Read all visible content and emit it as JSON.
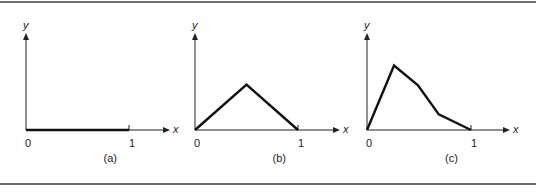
{
  "panels": [
    {
      "id": "a",
      "caption": "(a)",
      "x_axis_label": "x",
      "y_axis_label": "y",
      "tick_labels": [
        "0",
        "1"
      ],
      "origin": [
        26,
        130
      ],
      "unit_px": 103,
      "axis_end_x": 170,
      "axis_top_y": 33,
      "points": [
        [
          0,
          0
        ],
        [
          1,
          0
        ]
      ]
    },
    {
      "id": "b",
      "caption": "(b)",
      "x_axis_label": "x",
      "y_axis_label": "y",
      "tick_labels": [
        "0",
        "1"
      ],
      "origin": [
        195,
        130
      ],
      "unit_px": 103,
      "axis_end_x": 340,
      "axis_top_y": 33,
      "points": [
        [
          0,
          0
        ],
        [
          0.5,
          0.44
        ],
        [
          1,
          0
        ]
      ]
    },
    {
      "id": "c",
      "caption": "(c)",
      "x_axis_label": "x",
      "y_axis_label": "y",
      "tick_labels": [
        "0",
        "1"
      ],
      "origin": [
        367,
        130
      ],
      "unit_px": 104,
      "axis_end_x": 510,
      "axis_top_y": 33,
      "points": [
        [
          0,
          0
        ],
        [
          0.26,
          0.62
        ],
        [
          0.49,
          0.43
        ],
        [
          0.69,
          0.15
        ],
        [
          1,
          0
        ]
      ]
    }
  ],
  "colors": {
    "line": "#111111",
    "axis": "#222222",
    "rule": "#6e6e6e"
  }
}
